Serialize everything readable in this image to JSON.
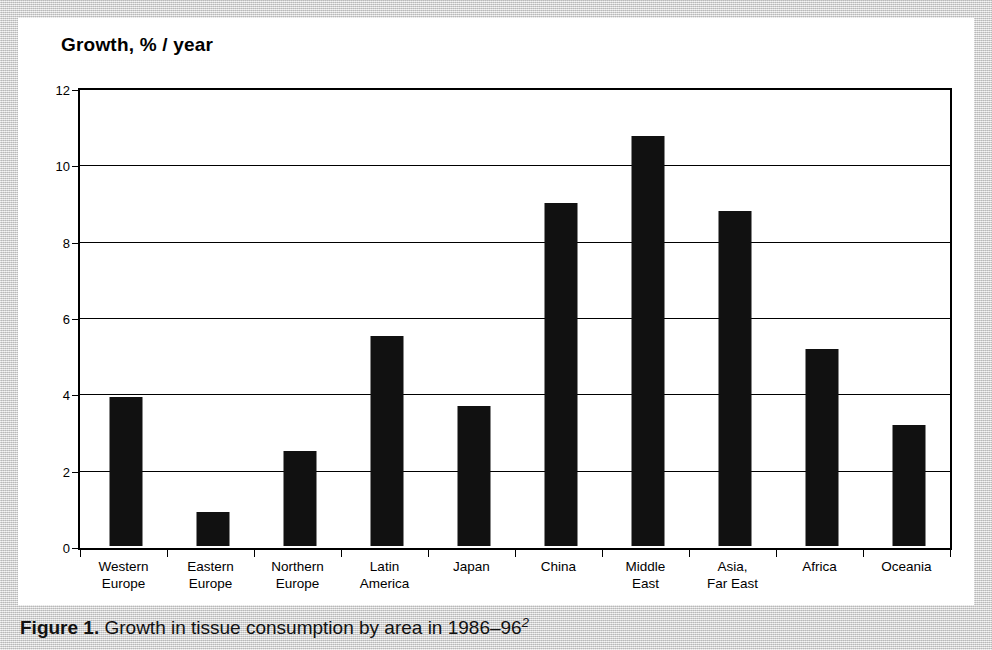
{
  "chart": {
    "axis_title": "Growth, % / year"
  },
  "caption": {
    "label": "Figure 1.",
    "text": "Growth in tissue consumption by area in 1986–96",
    "superscript": "2"
  },
  "chart_data": {
    "type": "bar",
    "title": "Growth, % / year",
    "xlabel": "",
    "ylabel": "Growth, % / year",
    "ylim": [
      0,
      12
    ],
    "yticks": [
      0,
      2,
      4,
      6,
      8,
      10,
      12
    ],
    "ytick_labels": [
      "0",
      "2",
      "4",
      "6",
      "8",
      "10",
      "12"
    ],
    "grid": true,
    "legend": false,
    "bar_color": "#111111",
    "categories": [
      "Western Europe",
      "Eastern Europe",
      "Northern Europe",
      "Latin America",
      "Japan",
      "China",
      "Middle East",
      "Asia, Far East",
      "Africa",
      "Oceania"
    ],
    "category_lines": [
      [
        "Western",
        "Europe"
      ],
      [
        "Eastern",
        "Europe"
      ],
      [
        "Northern",
        "Europe"
      ],
      [
        "Latin",
        "America"
      ],
      [
        "Japan"
      ],
      [
        "China"
      ],
      [
        "Middle",
        "East"
      ],
      [
        "Asia,",
        "Far East"
      ],
      [
        "Africa"
      ],
      [
        "Oceania"
      ]
    ],
    "values": [
      3.9,
      0.9,
      2.5,
      5.5,
      3.67,
      8.98,
      10.75,
      8.77,
      5.17,
      3.17
    ]
  }
}
